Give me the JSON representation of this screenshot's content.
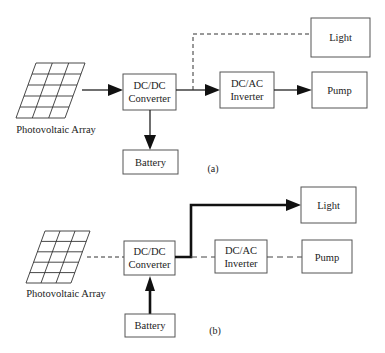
{
  "diagrams": [
    {
      "id": "a",
      "caption": "(a)",
      "nodes": {
        "pv_array": "Photovoltaic Array",
        "dcdc_line1": "DC/DC",
        "dcdc_line2": "Converter",
        "battery": "Battery",
        "dcac_line1": "DC/AC",
        "dcac_line2": "Inverter",
        "light": "Light",
        "pump": "Pump"
      },
      "edges": [
        {
          "from": "Photovoltaic Array",
          "to": "DC/DC Converter",
          "style": "solid-arrow"
        },
        {
          "from": "DC/DC Converter",
          "to": "Battery",
          "style": "solid-arrow"
        },
        {
          "from": "DC/DC Converter",
          "to": "DC/AC Inverter",
          "style": "solid-arrow"
        },
        {
          "from": "DC/AC Inverter",
          "to": "Pump",
          "style": "solid-arrow"
        },
        {
          "from": "DC/DC Converter",
          "to": "Light",
          "style": "dashed"
        }
      ]
    },
    {
      "id": "b",
      "caption": "(b)",
      "nodes": {
        "pv_array": "Photovoltaic Array",
        "dcdc_line1": "DC/DC",
        "dcdc_line2": "Converter",
        "battery": "Battery",
        "dcac_line1": "DC/AC",
        "dcac_line2": "Inverter",
        "light": "Light",
        "pump": "Pump"
      },
      "edges": [
        {
          "from": "Photovoltaic Array",
          "to": "DC/DC Converter",
          "style": "dashed"
        },
        {
          "from": "Battery",
          "to": "DC/DC Converter",
          "style": "thick-arrow"
        },
        {
          "from": "DC/DC Converter",
          "to": "Light",
          "style": "thick-arrow"
        },
        {
          "from": "DC/DC Converter",
          "to": "DC/AC Inverter",
          "style": "dashed"
        },
        {
          "from": "DC/AC Inverter",
          "to": "Pump",
          "style": "dashed"
        }
      ]
    }
  ]
}
